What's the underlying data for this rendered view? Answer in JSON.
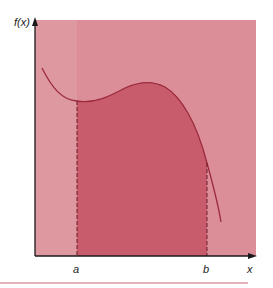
{
  "diagram": {
    "y_axis_label": "f(x)",
    "x_axis_label": "x",
    "lower_bound_label": "a",
    "upper_bound_label": "b",
    "colors": {
      "background_region": "#dc8e98",
      "left_strip": "#e2a0a9",
      "shaded_area": "#c95c6c",
      "curve": "#9a2a3c",
      "axis": "#1a1a1a",
      "dashed_bounds": "#6a1a2a",
      "rule_line": "#d79aa2"
    }
  }
}
